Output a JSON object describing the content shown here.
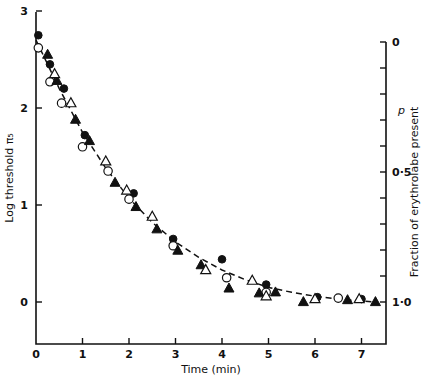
{
  "chart_data": {
    "type": "scatter",
    "title": "",
    "xlabel": "Time (min)",
    "ylabel": "Log threshold π₅",
    "ylabel_right": "Fraction of erythrolabe present",
    "right_symbol": "p",
    "xlim": [
      0,
      7.5
    ],
    "ylim": [
      -0.43,
      3.0
    ],
    "x_ticks": [
      0,
      1,
      2,
      3,
      4,
      5,
      6,
      7
    ],
    "x_tick_labels": [
      "0",
      "1",
      "2",
      "3",
      "4",
      "5",
      "6",
      "7"
    ],
    "y_ticks": [
      0,
      1,
      2,
      3
    ],
    "y_tick_labels": [
      "0",
      "1",
      "2",
      "3"
    ],
    "right_axis": {
      "range_top_to_bottom": [
        0,
        1.0
      ],
      "ticks": [
        0,
        0.1,
        0.2,
        0.3,
        0.4,
        0.5,
        0.6,
        0.7,
        0.8,
        0.9,
        1.0
      ],
      "labeled": {
        "0": "0",
        "0.5": "0·5",
        "1.0": "1·0"
      }
    },
    "grid": false,
    "legend": null,
    "series": [
      {
        "name": "filled circles",
        "marker": "filled-circle",
        "points": [
          [
            0.05,
            2.75
          ],
          [
            0.3,
            2.45
          ],
          [
            0.6,
            2.2
          ],
          [
            1.05,
            1.72
          ],
          [
            2.1,
            1.12
          ],
          [
            2.95,
            0.65
          ],
          [
            4.0,
            0.44
          ],
          [
            4.95,
            0.18
          ],
          [
            6.05,
            0.05
          ],
          [
            7.0,
            0.03
          ]
        ]
      },
      {
        "name": "open circles",
        "marker": "open-circle",
        "points": [
          [
            0.05,
            2.62
          ],
          [
            0.3,
            2.27
          ],
          [
            0.55,
            2.05
          ],
          [
            1.0,
            1.6
          ],
          [
            1.55,
            1.35
          ],
          [
            2.0,
            1.06
          ],
          [
            2.95,
            0.58
          ],
          [
            4.1,
            0.25
          ],
          [
            4.95,
            0.1
          ],
          [
            6.5,
            0.04
          ]
        ]
      },
      {
        "name": "filled triangles",
        "marker": "filled-triangle",
        "points": [
          [
            0.25,
            2.55
          ],
          [
            0.45,
            2.28
          ],
          [
            0.85,
            1.88
          ],
          [
            1.15,
            1.66
          ],
          [
            1.7,
            1.23
          ],
          [
            2.15,
            0.98
          ],
          [
            2.6,
            0.75
          ],
          [
            3.05,
            0.53
          ],
          [
            3.55,
            0.38
          ],
          [
            4.15,
            0.14
          ],
          [
            4.8,
            0.09
          ],
          [
            5.15,
            0.1
          ],
          [
            5.75,
            0.0
          ],
          [
            6.7,
            0.02
          ],
          [
            7.3,
            0.0
          ]
        ]
      },
      {
        "name": "open triangles",
        "marker": "open-triangle",
        "points": [
          [
            0.4,
            2.35
          ],
          [
            0.75,
            2.05
          ],
          [
            1.5,
            1.45
          ],
          [
            1.95,
            1.15
          ],
          [
            2.5,
            0.88
          ],
          [
            3.65,
            0.33
          ],
          [
            4.65,
            0.22
          ],
          [
            4.95,
            0.06
          ],
          [
            6.0,
            0.03
          ],
          [
            6.95,
            0.03
          ]
        ]
      }
    ],
    "fit_curve": {
      "style": "dashed",
      "description": "exponential decay fit",
      "points": [
        [
          0,
          2.7
        ],
        [
          0.5,
          2.2
        ],
        [
          1,
          1.75
        ],
        [
          1.5,
          1.38
        ],
        [
          2,
          1.07
        ],
        [
          2.5,
          0.82
        ],
        [
          3,
          0.62
        ],
        [
          3.5,
          0.46
        ],
        [
          4,
          0.33
        ],
        [
          4.5,
          0.23
        ],
        [
          5,
          0.15
        ],
        [
          5.5,
          0.1
        ],
        [
          6,
          0.06
        ],
        [
          6.5,
          0.03
        ],
        [
          7,
          0.01
        ],
        [
          7.3,
          0.0
        ]
      ]
    }
  },
  "labels": {
    "xlabel": "Time (min)",
    "ylabel": "Log threshold π₅",
    "ylabel_right": "Fraction of erythrolabe present",
    "right_symbol": "p"
  }
}
